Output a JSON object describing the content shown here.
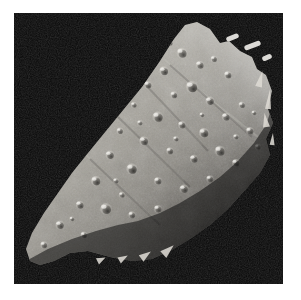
{
  "figure": {
    "kind": "grayscale-spacecraft-photograph",
    "caption": "",
    "title": "",
    "background_color": "#ffffff",
    "plate_color": "#070707"
  },
  "plate": {
    "x": 14,
    "y": 13,
    "width": 269,
    "height": 271,
    "space_color": "#070707",
    "noise_opacity": 0.55
  },
  "asteroid": {
    "name": "asteroid-body",
    "lit_limb_color": "#d9d6ce",
    "mid_tone_color": "#9e9a92",
    "shadow_tone_color": "#4a4843",
    "terminator_color": "#0d0d0d",
    "outline_points": "171,12 183,9 196,16 206,30 215,28 226,38 238,44 243,56 252,62 258,78 254,96 259,110 252,126 256,142 246,160 232,176 214,196 196,212 176,226 156,238 138,246 118,248 96,244 74,238 56,240 40,248 26,252 16,248 12,236 18,220 30,200 44,180 58,160 74,140 92,118 110,96 128,74 146,48 160,26",
    "terminator_points": "12,248 34,236 58,226 82,218 104,212 124,208 146,200 166,190 186,178 206,164 224,148 240,130 252,112 258,94",
    "craters": [
      {
        "cx": 168,
        "cy": 40,
        "r": 4.0,
        "depth": 0.55
      },
      {
        "cx": 186,
        "cy": 52,
        "r": 3.2,
        "depth": 0.5
      },
      {
        "cx": 150,
        "cy": 58,
        "r": 3.6,
        "depth": 0.6
      },
      {
        "cx": 200,
        "cy": 46,
        "r": 2.6,
        "depth": 0.45
      },
      {
        "cx": 214,
        "cy": 62,
        "r": 3.0,
        "depth": 0.5
      },
      {
        "cx": 178,
        "cy": 74,
        "r": 4.6,
        "depth": 0.65
      },
      {
        "cx": 196,
        "cy": 88,
        "r": 3.4,
        "depth": 0.55
      },
      {
        "cx": 160,
        "cy": 82,
        "r": 2.8,
        "depth": 0.5
      },
      {
        "cx": 134,
        "cy": 72,
        "r": 3.0,
        "depth": 0.5
      },
      {
        "cx": 120,
        "cy": 92,
        "r": 2.4,
        "depth": 0.45
      },
      {
        "cx": 144,
        "cy": 104,
        "r": 4.2,
        "depth": 0.6
      },
      {
        "cx": 168,
        "cy": 112,
        "r": 3.0,
        "depth": 0.5
      },
      {
        "cx": 190,
        "cy": 120,
        "r": 3.8,
        "depth": 0.6
      },
      {
        "cx": 212,
        "cy": 104,
        "r": 3.2,
        "depth": 0.5
      },
      {
        "cx": 228,
        "cy": 92,
        "r": 2.6,
        "depth": 0.45
      },
      {
        "cx": 236,
        "cy": 118,
        "r": 3.0,
        "depth": 0.5
      },
      {
        "cx": 206,
        "cy": 138,
        "r": 4.0,
        "depth": 0.6
      },
      {
        "cx": 180,
        "cy": 146,
        "r": 3.2,
        "depth": 0.55
      },
      {
        "cx": 156,
        "cy": 138,
        "r": 2.8,
        "depth": 0.5
      },
      {
        "cx": 130,
        "cy": 128,
        "r": 3.6,
        "depth": 0.55
      },
      {
        "cx": 106,
        "cy": 118,
        "r": 2.6,
        "depth": 0.45
      },
      {
        "cx": 96,
        "cy": 142,
        "r": 3.4,
        "depth": 0.55
      },
      {
        "cx": 118,
        "cy": 156,
        "r": 4.2,
        "depth": 0.65
      },
      {
        "cx": 144,
        "cy": 168,
        "r": 3.0,
        "depth": 0.5
      },
      {
        "cx": 170,
        "cy": 176,
        "r": 3.4,
        "depth": 0.55
      },
      {
        "cx": 196,
        "cy": 166,
        "r": 2.8,
        "depth": 0.5
      },
      {
        "cx": 222,
        "cy": 150,
        "r": 3.0,
        "depth": 0.5
      },
      {
        "cx": 244,
        "cy": 134,
        "r": 2.4,
        "depth": 0.4
      },
      {
        "cx": 82,
        "cy": 168,
        "r": 3.8,
        "depth": 0.6
      },
      {
        "cx": 66,
        "cy": 192,
        "r": 3.2,
        "depth": 0.55
      },
      {
        "cx": 92,
        "cy": 196,
        "r": 4.4,
        "depth": 0.6
      },
      {
        "cx": 118,
        "cy": 202,
        "r": 2.8,
        "depth": 0.5
      },
      {
        "cx": 144,
        "cy": 196,
        "r": 3.0,
        "depth": 0.5
      },
      {
        "cx": 46,
        "cy": 212,
        "r": 3.4,
        "depth": 0.55
      },
      {
        "cx": 70,
        "cy": 222,
        "r": 2.6,
        "depth": 0.45
      },
      {
        "cx": 30,
        "cy": 232,
        "r": 2.8,
        "depth": 0.5
      },
      {
        "cx": 102,
        "cy": 168,
        "r": 2.2,
        "depth": 0.4
      },
      {
        "cx": 126,
        "cy": 110,
        "r": 2.2,
        "depth": 0.4
      },
      {
        "cx": 156,
        "cy": 30,
        "r": 2.4,
        "depth": 0.45
      },
      {
        "cx": 222,
        "cy": 124,
        "r": 2.2,
        "depth": 0.4
      },
      {
        "cx": 240,
        "cy": 100,
        "r": 2.0,
        "depth": 0.4
      },
      {
        "cx": 108,
        "cy": 182,
        "r": 2.4,
        "depth": 0.45
      },
      {
        "cx": 58,
        "cy": 206,
        "r": 2.0,
        "depth": 0.4
      },
      {
        "cx": 188,
        "cy": 102,
        "r": 2.0,
        "depth": 0.4
      },
      {
        "cx": 162,
        "cy": 126,
        "r": 2.2,
        "depth": 0.42
      }
    ],
    "bright_fragments": [
      {
        "x": 212,
        "y": 22,
        "w": 13,
        "h": 5,
        "rot": -22
      },
      {
        "x": 230,
        "y": 30,
        "w": 17,
        "h": 5,
        "rot": -20
      },
      {
        "x": 248,
        "y": 42,
        "w": 10,
        "h": 5,
        "rot": -24
      }
    ],
    "limb_spikes": [
      {
        "x": 243,
        "y": 58,
        "w": 7,
        "h": 16,
        "rot": 14
      },
      {
        "x": 252,
        "y": 76,
        "w": 6,
        "h": 20,
        "rot": 6
      },
      {
        "x": 248,
        "y": 100,
        "w": 7,
        "h": 14,
        "rot": -8
      },
      {
        "x": 256,
        "y": 120,
        "w": 5,
        "h": 12,
        "rot": 4
      },
      {
        "x": 150,
        "y": 230,
        "w": 9,
        "h": 14,
        "rot": 48
      },
      {
        "x": 128,
        "y": 236,
        "w": 8,
        "h": 12,
        "rot": 54
      },
      {
        "x": 106,
        "y": 240,
        "w": 7,
        "h": 10,
        "rot": 60
      },
      {
        "x": 84,
        "y": 242,
        "w": 7,
        "h": 9,
        "rot": 64
      }
    ]
  },
  "colors": {
    "white": "#ffffff",
    "space": "#070707",
    "highlight": "#ececea",
    "midtone": "#a3a099",
    "shadow": "#3c3a36"
  }
}
